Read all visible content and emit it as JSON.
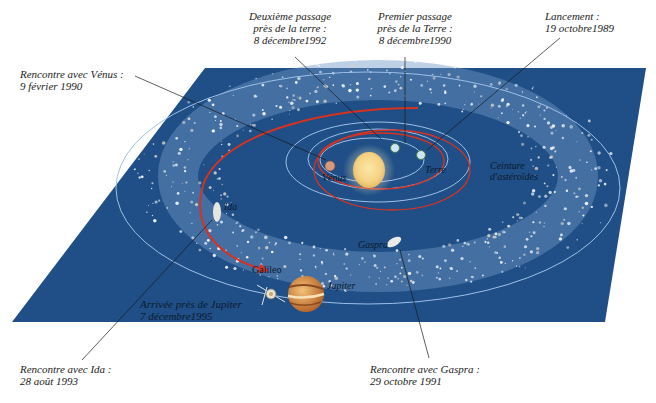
{
  "colors": {
    "plane": "#1f4f86",
    "plane_edge": "#2c5c92",
    "orbit": "#8fb4e0",
    "trajectory": "#d8321f",
    "sun": "#f6d98a",
    "leader_line": "#1a1a1a",
    "text": "#222222"
  },
  "callouts": [
    {
      "id": "venus",
      "lines": [
        "Rencontre avec Vénus :",
        "9 février 1990"
      ]
    },
    {
      "id": "earth2",
      "lines": [
        "Deuxième passage",
        "près de la terre :",
        "8 décembre1992"
      ]
    },
    {
      "id": "earth1",
      "lines": [
        "Premier passage",
        "près de la Terre :",
        "8 décembre1990"
      ]
    },
    {
      "id": "launch",
      "lines": [
        "Lancement :",
        "19 octobre1989"
      ]
    },
    {
      "id": "ida",
      "lines": [
        "Rencontre avec Ida :",
        "28 août 1993"
      ]
    },
    {
      "id": "gaspra",
      "lines": [
        "Rencontre avec Gaspra :",
        "29 octobre 1991"
      ]
    },
    {
      "id": "jupiter_arrival",
      "lines": [
        "Arrivée près de Jupiter",
        "7 décembre1995"
      ]
    }
  ],
  "diagram_labels": {
    "venus": "Vénus",
    "earth": "Terre",
    "belt_line1": "Ceinture",
    "belt_line2": "d'astéroïdes",
    "ida": "Ida",
    "gaspra": "Gaspra",
    "galileo": "Galileo",
    "jupiter": "Jupiter"
  },
  "bodies": [
    {
      "name": "Soleil",
      "icon": "sun-icon"
    },
    {
      "name": "Vénus",
      "icon": "planet-icon"
    },
    {
      "name": "Terre",
      "icon": "planet-icon"
    },
    {
      "name": "Jupiter",
      "icon": "planet-icon"
    },
    {
      "name": "Ida",
      "icon": "asteroid-icon"
    },
    {
      "name": "Gaspra",
      "icon": "asteroid-icon"
    },
    {
      "name": "Galileo",
      "icon": "spacecraft-icon"
    }
  ]
}
